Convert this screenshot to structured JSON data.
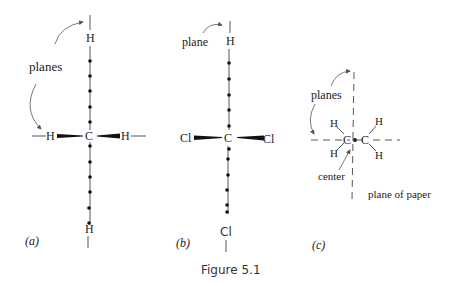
{
  "figure": {
    "caption": "Figure 5.1",
    "panels": [
      {
        "id": "a",
        "label": "(a)",
        "annotation": "planes",
        "atoms": {
          "top": "H",
          "center": "C",
          "left": "H",
          "right": "H",
          "bottom": "H"
        }
      },
      {
        "id": "b",
        "label": "(b)",
        "annotation": "plane",
        "atoms": {
          "top": "H",
          "center": "C",
          "left": "Cl",
          "right": "Cl",
          "bottom": "Cl"
        }
      },
      {
        "id": "c",
        "label": "(c)",
        "annotation": "planes",
        "center_label": "center",
        "plane_label": "plane of paper",
        "atoms": {
          "c1": "C",
          "c2": "C",
          "h1": "H",
          "h2": "H",
          "h3": "H",
          "h4": "H"
        }
      }
    ]
  }
}
